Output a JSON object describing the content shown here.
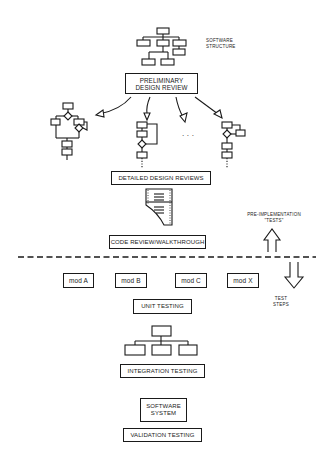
{
  "diagram": {
    "top_note": "SOFTWARE\nSTRUCTURE",
    "stages": {
      "preliminary_design_review": "PRELIMINARY\nDESIGN REVIEW",
      "detailed_design_reviews": "DETAILED DESIGN REVIEWS",
      "code_review": "CODE REVIEW/WALKTHROUGH",
      "unit_testing": "UNIT TESTING",
      "integration_testing": "INTEGRATION TESTING",
      "software_system": "SOFTWARE\nSYSTEM",
      "validation_testing": "VALIDATION TESTING"
    },
    "modules": [
      "mod A",
      "mod B",
      "mod C",
      "mod X"
    ],
    "ellipsis": ". . .",
    "side_notes": {
      "pre_implementation": "PRE-IMPLEMENTATION\n\"TESTS\"",
      "test_steps": "TEST\nSTEPS"
    },
    "arrows": {
      "up": "arrow-up-icon",
      "down": "arrow-down-icon"
    },
    "colors": {
      "ink": "#1a1a1a",
      "background": "#ffffff"
    }
  }
}
